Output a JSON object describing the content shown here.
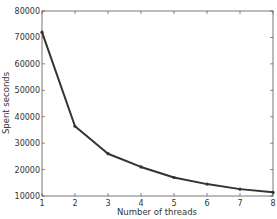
{
  "chart_data": {
    "type": "line",
    "title": "",
    "xlabel": "Number of threads",
    "ylabel": "Spent seconds",
    "x": [
      1,
      2,
      3,
      4,
      5,
      6,
      7,
      8
    ],
    "series": [
      {
        "name": "Spent seconds",
        "values": [
          72000,
          36400,
          26000,
          21000,
          17000,
          14500,
          12600,
          11400
        ],
        "color": "#333333"
      }
    ],
    "xlim": [
      1,
      8
    ],
    "ylim": [
      10000,
      80000
    ],
    "xticks": [
      "1",
      "2",
      "3",
      "4",
      "5",
      "6",
      "7",
      "8"
    ],
    "yticks": [
      "10000",
      "20000",
      "30000",
      "40000",
      "50000",
      "60000",
      "70000",
      "80000"
    ],
    "grid": false,
    "legend": null
  }
}
